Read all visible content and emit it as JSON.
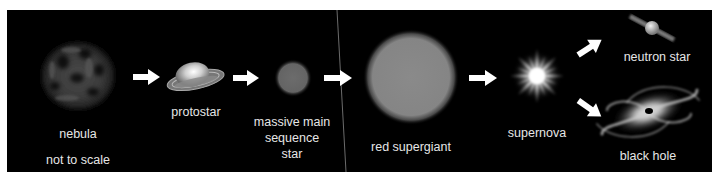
{
  "diagram": {
    "background": "#000000",
    "foreground_text": "#e6e6e6",
    "arrow_color": "#ffffff",
    "note": "not to scale",
    "stages": [
      {
        "id": "nebula",
        "label": "nebula"
      },
      {
        "id": "protostar",
        "label": "protostar"
      },
      {
        "id": "main-sequence",
        "label_lines": [
          "massive main",
          "sequence",
          "star"
        ]
      },
      {
        "id": "red-supergiant",
        "label": "red supergiant"
      },
      {
        "id": "supernova",
        "label": "supernova"
      },
      {
        "id": "neutron-star",
        "label": "neutron star"
      },
      {
        "id": "black-hole",
        "label": "black hole"
      }
    ],
    "flow": [
      [
        "nebula",
        "protostar"
      ],
      [
        "protostar",
        "main-sequence"
      ],
      [
        "main-sequence",
        "red-supergiant"
      ],
      [
        "red-supergiant",
        "supernova"
      ],
      [
        "supernova",
        "neutron-star"
      ],
      [
        "supernova",
        "black-hole"
      ]
    ]
  }
}
